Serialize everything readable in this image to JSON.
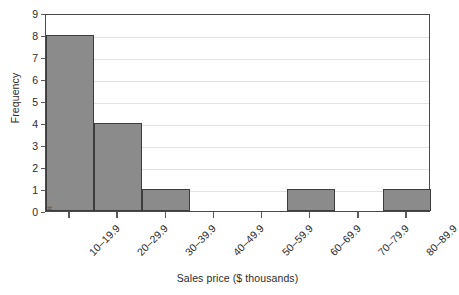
{
  "chart_data": {
    "type": "bar",
    "title": "",
    "subtitle": "",
    "xlabel": "Sales price ($ thousands)",
    "ylabel": "Frequency",
    "categories": [
      "10–19.9",
      "20–29.9",
      "30–39.9",
      "40–49.9",
      "50–59.9",
      "60–69.9",
      "70–79.9",
      "80–89.9"
    ],
    "values": [
      8,
      4,
      1,
      0,
      0,
      1,
      0,
      1
    ],
    "ylim": [
      0,
      9
    ],
    "y_ticks": [
      0,
      1,
      2,
      3,
      4,
      5,
      6,
      7,
      8,
      9
    ],
    "y_tick_labels": [
      "0",
      "1",
      "2",
      "3",
      "4",
      "5",
      "6",
      "7",
      "8",
      "9"
    ],
    "grid": true,
    "grid_axis": "y",
    "legend": false,
    "legend_position": "none",
    "bar_gap": 0,
    "annotations": [
      "#"
    ],
    "colors": {
      "bar_fill": "#8b8b8b",
      "bar_edge": "#3d3d3d",
      "frame": "#4a4a4a",
      "gridline": "#e2e2e2",
      "text": "#2b2b2b",
      "background": "#ffffff"
    }
  }
}
